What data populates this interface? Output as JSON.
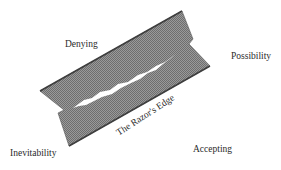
{
  "diagram": {
    "labels": {
      "denying": "Denying",
      "possibility": "Possibility",
      "inevitability": "Inevitability",
      "accepting": "Accepting",
      "razors_edge": "The Razor's Edge"
    },
    "colors": {
      "blade_fill": "#8c8c8c",
      "blade_edge": "#4a4a4a",
      "slot_fill": "#ffffff",
      "text": "#2a2a2a"
    }
  }
}
